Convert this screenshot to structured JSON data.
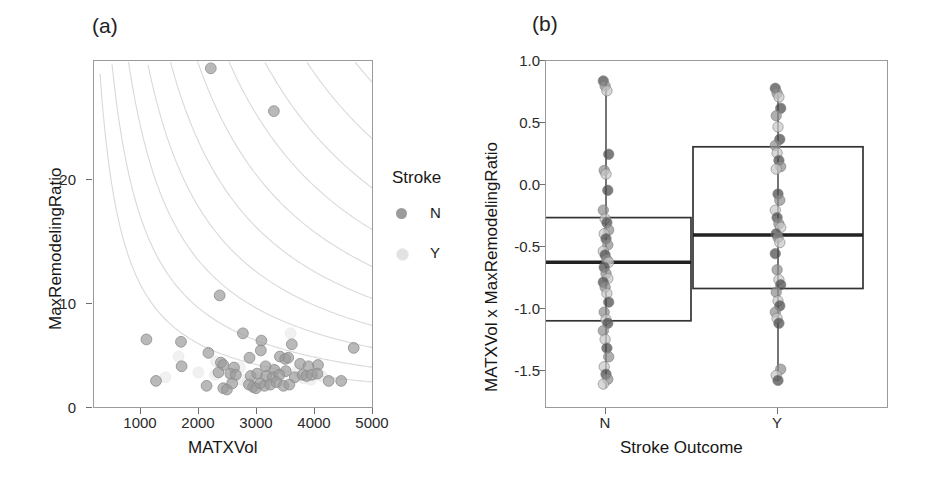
{
  "figure": {
    "background": "#ffffff",
    "width": 938,
    "height": 478
  },
  "panel_a": {
    "tag": "(a)",
    "xlabel": "MATXVol",
    "ylabel": "MaxRemodelingRatio",
    "xticks": [
      "1000",
      "2000",
      "3000",
      "4000",
      "5000"
    ],
    "yticks": [
      "0",
      "10",
      "20"
    ],
    "legend": {
      "title": "Stroke",
      "items": [
        {
          "label": "N",
          "color": "#9b9b9b",
          "swatch_name": "legend-swatch-n"
        },
        {
          "label": "Y",
          "color": "#e2e2e2",
          "swatch_name": "legend-swatch-y"
        }
      ]
    }
  },
  "panel_b": {
    "tag": "(b)",
    "xlabel": "Stroke Outcome",
    "ylabel": "MATXVol x MaxRemodelingRatio",
    "xticks": [
      "N",
      "Y"
    ],
    "yticks": [
      "1.0",
      "0.5",
      "0.0",
      "-0.5",
      "-1.0",
      "-1.5"
    ]
  },
  "chart_data": [
    {
      "type": "scatter",
      "id": "panel-a-scatter",
      "title": "(a)",
      "xlabel": "MATXVol",
      "ylabel": "MaxRemodelingRatio",
      "xlim": [
        300,
        5000
      ],
      "ylim": [
        0,
        28.5
      ],
      "xticks": [
        1000,
        2000,
        3000,
        4000,
        5000
      ],
      "yticks": [
        0,
        10,
        20
      ],
      "grid": false,
      "legend": {
        "title": "Stroke",
        "position": "right",
        "entries": [
          "N",
          "Y"
        ]
      },
      "contour_lines": {
        "description": "hyperbolic iso-product curves x*y = c",
        "constants": [
          11000,
          17000,
          25000,
          34000,
          45000,
          58000,
          73000,
          90000,
          110000,
          133000,
          158000
        ],
        "color": "#d9d9d9"
      },
      "series": [
        {
          "name": "N",
          "color": "#9b9b9b",
          "points": [
            [
              2260,
              27.9
            ],
            [
              3320,
              24.4
            ],
            [
              2410,
              9.3
            ],
            [
              2800,
              6.2
            ],
            [
              3110,
              5.6
            ],
            [
              1180,
              5.7
            ],
            [
              1760,
              5.5
            ],
            [
              3620,
              5.3
            ],
            [
              4660,
              5.0
            ],
            [
              2220,
              4.6
            ],
            [
              3100,
              4.8
            ],
            [
              3420,
              4.3
            ],
            [
              2910,
              4.2
            ],
            [
              3510,
              4.1
            ],
            [
              3560,
              4.2
            ],
            [
              1770,
              3.5
            ],
            [
              2430,
              3.8
            ],
            [
              2470,
              3.6
            ],
            [
              2650,
              3.4
            ],
            [
              3180,
              3.5
            ],
            [
              3760,
              3.7
            ],
            [
              3900,
              3.5
            ],
            [
              4060,
              3.6
            ],
            [
              3330,
              3.2
            ],
            [
              3520,
              3.1
            ],
            [
              2390,
              3.0
            ],
            [
              2590,
              2.9
            ],
            [
              2680,
              2.8
            ],
            [
              2930,
              2.7
            ],
            [
              3040,
              2.9
            ],
            [
              3190,
              2.7
            ],
            [
              3300,
              2.6
            ],
            [
              3410,
              2.8
            ],
            [
              3670,
              2.6
            ],
            [
              3800,
              2.8
            ],
            [
              3870,
              2.7
            ],
            [
              3960,
              2.8
            ],
            [
              4050,
              2.9
            ],
            [
              4240,
              2.3
            ],
            [
              4450,
              2.3
            ],
            [
              1340,
              2.3
            ],
            [
              2190,
              1.9
            ],
            [
              2470,
              1.7
            ],
            [
              2530,
              1.6
            ],
            [
              2620,
              2.1
            ],
            [
              2900,
              2.0
            ],
            [
              2970,
              1.8
            ],
            [
              3020,
              1.7
            ],
            [
              3090,
              2.1
            ],
            [
              3160,
              1.9
            ],
            [
              3260,
              2.0
            ],
            [
              3360,
              2.2
            ],
            [
              3480,
              1.9
            ],
            [
              3580,
              2.0
            ]
          ]
        },
        {
          "name": "Y",
          "color": "#e6e6e6",
          "points": [
            [
              2350,
              3.9
            ],
            [
              2600,
              2.6
            ],
            [
              2780,
              2.4
            ],
            [
              2880,
              2.2
            ],
            [
              3040,
              2.5
            ],
            [
              3150,
              2.3
            ],
            [
              3240,
              2.6
            ],
            [
              3400,
              2.2
            ],
            [
              3600,
              6.2
            ],
            [
              3720,
              3.1
            ],
            [
              1720,
              4.3
            ],
            [
              2050,
              3.0
            ],
            [
              2330,
              2.8
            ],
            [
              3820,
              2.5
            ],
            [
              3940,
              2.4
            ],
            [
              2750,
              3.4
            ],
            [
              3290,
              3.3
            ],
            [
              3470,
              2.9
            ],
            [
              4120,
              2.7
            ],
            [
              1500,
              2.6
            ]
          ]
        }
      ]
    },
    {
      "type": "box",
      "id": "panel-b-boxplot",
      "title": "(b)",
      "xlabel": "Stroke Outcome",
      "ylabel": "MATXVol x MaxRemodelingRatio",
      "ylim": [
        -1.72,
        1.08
      ],
      "yticks": [
        1.0,
        0.5,
        0.0,
        -0.5,
        -1.0,
        -1.5
      ],
      "categories": [
        "N",
        "Y"
      ],
      "grid": false,
      "boxes": [
        {
          "category": "N",
          "whisker_low": -1.55,
          "q1": -1.01,
          "median": -0.54,
          "q3": -0.18,
          "whisker_high": 0.92,
          "points": [
            0.92,
            0.88,
            0.84,
            0.33,
            0.2,
            0.17,
            0.04,
            -0.12,
            -0.19,
            -0.22,
            -0.28,
            -0.31,
            -0.35,
            -0.4,
            -0.45,
            -0.48,
            -0.52,
            -0.54,
            -0.58,
            -0.63,
            -0.67,
            -0.7,
            -0.74,
            -0.79,
            -0.86,
            -0.94,
            -1.0,
            -1.03,
            -1.09,
            -1.16,
            -1.23,
            -1.3,
            -1.38,
            -1.44,
            -1.48,
            -1.52
          ]
        },
        {
          "category": "Y",
          "whisker_low": -1.49,
          "q1": -0.75,
          "median": -0.32,
          "q3": 0.39,
          "whisker_high": 0.86,
          "points": [
            0.86,
            0.82,
            0.79,
            0.7,
            0.64,
            0.55,
            0.45,
            0.4,
            0.34,
            0.28,
            0.23,
            0.21,
            0.01,
            -0.04,
            -0.12,
            -0.18,
            -0.23,
            -0.26,
            -0.31,
            -0.34,
            -0.38,
            -0.47,
            -0.6,
            -0.68,
            -0.72,
            -0.78,
            -0.85,
            -0.89,
            -0.94,
            -0.99,
            -1.03,
            -1.4,
            -1.45,
            -1.49
          ]
        }
      ]
    }
  ]
}
